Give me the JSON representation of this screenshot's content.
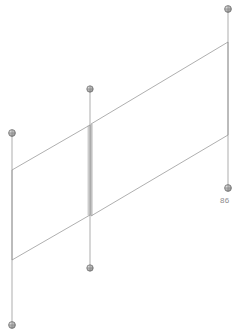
{
  "canvas": {
    "width": 246,
    "height": 336,
    "background": "#ffffff"
  },
  "style": {
    "edge_color": "#9a9a9a",
    "edge_color_light": "#b4b4b4",
    "post_color": "#a8a8a8",
    "node_fill": "#b0b0b0",
    "node_stroke": "#6e6e6e",
    "label_color": "#8d8d8d",
    "edge_width": 0.8,
    "post_width": 0.9
  },
  "drawing": {
    "title": "isometric-wireframe-panels",
    "panels": [
      {
        "name": "left-panel",
        "points": "12,170 90,125 90,215 12,260",
        "corners": [
          {
            "name": "left-panel-top-left",
            "x": 12,
            "y": 170
          },
          {
            "name": "left-panel-top-right",
            "x": 90,
            "y": 125
          },
          {
            "name": "left-panel-bottom-right",
            "x": 90,
            "y": 215
          },
          {
            "name": "left-panel-bottom-left",
            "x": 12,
            "y": 260
          }
        ]
      },
      {
        "name": "right-panel",
        "points": "91,124 228,42 228,135 91,216",
        "corners": [
          {
            "name": "right-panel-top-left",
            "x": 91,
            "y": 124
          },
          {
            "name": "right-panel-top-right",
            "x": 228,
            "y": 42
          },
          {
            "name": "right-panel-bottom-right",
            "x": 228,
            "y": 135
          },
          {
            "name": "right-panel-bottom-left",
            "x": 91,
            "y": 216
          }
        ]
      }
    ],
    "posts": [
      {
        "name": "post-left",
        "x": 12,
        "y_top": 133,
        "y_bottom": 325
      },
      {
        "name": "post-middle",
        "x": 90,
        "y_top": 89,
        "y_bottom": 268
      },
      {
        "name": "post-right",
        "x": 228,
        "y_top": 9,
        "y_bottom": 188
      }
    ],
    "nodes": [
      {
        "name": "node-left-top",
        "x": 12,
        "y": 133,
        "r": 3.4
      },
      {
        "name": "node-left-bottom",
        "x": 12,
        "y": 325,
        "r": 3.4
      },
      {
        "name": "node-middle-top",
        "x": 90,
        "y": 89,
        "r": 3.2
      },
      {
        "name": "node-middle-bottom",
        "x": 90,
        "y": 268,
        "r": 3.2
      },
      {
        "name": "node-right-top",
        "x": 228,
        "y": 9,
        "r": 3.4
      },
      {
        "name": "node-right-bottom",
        "x": 228,
        "y": 188,
        "r": 3.4
      }
    ],
    "labels": [
      {
        "name": "dimension-label-86",
        "text": "86",
        "x": 220,
        "y": 196
      }
    ]
  }
}
